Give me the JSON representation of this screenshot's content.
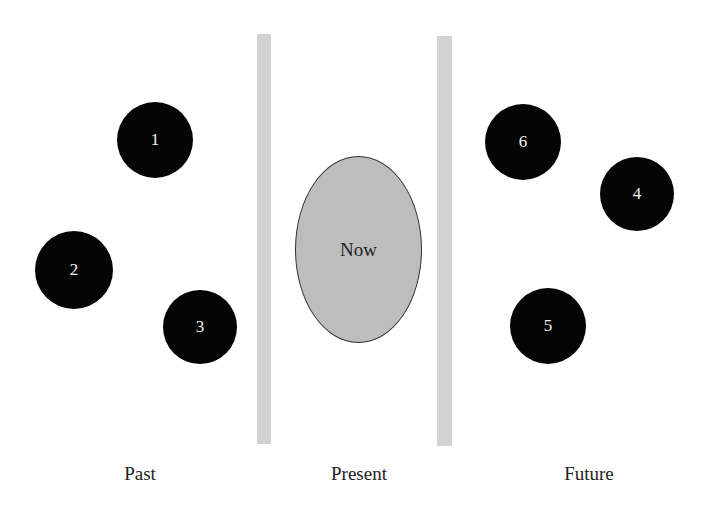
{
  "diagram": {
    "center_label": "Now",
    "sections": [
      {
        "label": "Past",
        "x": 140
      },
      {
        "label": "Present",
        "x": 359
      },
      {
        "label": "Future",
        "x": 589
      }
    ],
    "events": [
      {
        "label": "1",
        "cx": 155,
        "cy": 140,
        "r": 38,
        "section": "Past"
      },
      {
        "label": "2",
        "cx": 74,
        "cy": 270,
        "r": 39,
        "section": "Past"
      },
      {
        "label": "3",
        "cx": 200,
        "cy": 327,
        "r": 37,
        "section": "Past"
      },
      {
        "label": "6",
        "cx": 523,
        "cy": 142,
        "r": 38,
        "section": "Future"
      },
      {
        "label": "4",
        "cx": 637,
        "cy": 194,
        "r": 37,
        "section": "Future"
      },
      {
        "label": "5",
        "cx": 548,
        "cy": 326,
        "r": 38,
        "section": "Future"
      }
    ],
    "colors": {
      "divider": "#d3d3d3",
      "event_fill": "#050505",
      "now_fill": "#bdbdbd"
    }
  }
}
